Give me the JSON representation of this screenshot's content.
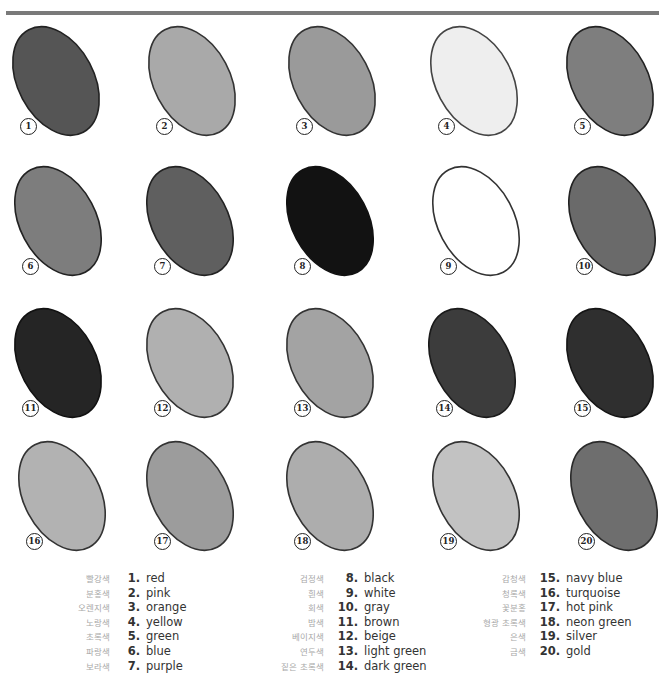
{
  "page": {
    "rule_color": "#7a7a7a"
  },
  "swatches": [
    {
      "number": "1",
      "name": "red",
      "fill": "#555555",
      "stroke": "#222222",
      "x": 12,
      "y": 28
    },
    {
      "number": "2",
      "name": "pink",
      "fill": "#a9a9a9",
      "stroke": "#333333",
      "x": 148,
      "y": 28
    },
    {
      "number": "3",
      "name": "orange",
      "fill": "#9a9a9a",
      "stroke": "#333333",
      "x": 288,
      "y": 28
    },
    {
      "number": "4",
      "name": "yellow",
      "fill": "#eeeeee",
      "stroke": "#444444",
      "x": 430,
      "y": 28
    },
    {
      "number": "5",
      "name": "green",
      "fill": "#7e7e7e",
      "stroke": "#222222",
      "x": 566,
      "y": 28
    },
    {
      "number": "6",
      "name": "blue",
      "fill": "#7d7d7d",
      "stroke": "#222222",
      "x": 14,
      "y": 168
    },
    {
      "number": "7",
      "name": "purple",
      "fill": "#5f5f5f",
      "stroke": "#222222",
      "x": 146,
      "y": 168
    },
    {
      "number": "8",
      "name": "black",
      "fill": "#121212",
      "stroke": "#111111",
      "x": 286,
      "y": 168
    },
    {
      "number": "9",
      "name": "white",
      "fill": "#ffffff",
      "stroke": "#333333",
      "x": 432,
      "y": 168
    },
    {
      "number": "10",
      "name": "gray",
      "fill": "#6a6a6a",
      "stroke": "#222222",
      "x": 568,
      "y": 168
    },
    {
      "number": "11",
      "name": "brown",
      "fill": "#252525",
      "stroke": "#111111",
      "x": 14,
      "y": 310
    },
    {
      "number": "12",
      "name": "beige",
      "fill": "#b0b0b0",
      "stroke": "#333333",
      "x": 146,
      "y": 310
    },
    {
      "number": "13",
      "name": "light green",
      "fill": "#a3a3a3",
      "stroke": "#333333",
      "x": 286,
      "y": 310
    },
    {
      "number": "14",
      "name": "dark green",
      "fill": "#3c3c3c",
      "stroke": "#1a1a1a",
      "x": 428,
      "y": 310
    },
    {
      "number": "15",
      "name": "navy blue",
      "fill": "#2f2f2f",
      "stroke": "#151515",
      "x": 566,
      "y": 310
    },
    {
      "number": "16",
      "name": "turquoise",
      "fill": "#b2b2b2",
      "stroke": "#333333",
      "x": 18,
      "y": 443
    },
    {
      "number": "17",
      "name": "hot pink",
      "fill": "#9c9c9c",
      "stroke": "#333333",
      "x": 146,
      "y": 443
    },
    {
      "number": "18",
      "name": "neon green",
      "fill": "#adadad",
      "stroke": "#333333",
      "x": 286,
      "y": 443
    },
    {
      "number": "19",
      "name": "silver",
      "fill": "#c2c2c2",
      "stroke": "#333333",
      "x": 432,
      "y": 443
    },
    {
      "number": "20",
      "name": "gold",
      "fill": "#6e6e6e",
      "stroke": "#2a2a2a",
      "x": 570,
      "y": 443
    }
  ],
  "legend": {
    "columns": [
      {
        "x": 66,
        "ko_width": 44,
        "num_width": 20,
        "items": [
          {
            "ko": "빨강색",
            "num": "1.",
            "en": "red"
          },
          {
            "ko": "분홍색",
            "num": "2.",
            "en": "pink"
          },
          {
            "ko": "오렌지색",
            "num": "3.",
            "en": "orange"
          },
          {
            "ko": "노랑색",
            "num": "4.",
            "en": "yellow"
          },
          {
            "ko": "초록색",
            "num": "5.",
            "en": "green"
          },
          {
            "ko": "파랑색",
            "num": "6.",
            "en": "blue"
          },
          {
            "ko": "보라색",
            "num": "7.",
            "en": "purple"
          }
        ]
      },
      {
        "x": 268,
        "ko_width": 56,
        "num_width": 24,
        "items": [
          {
            "ko": "검정색",
            "num": "8.",
            "en": "black"
          },
          {
            "ko": "흰색",
            "num": "9.",
            "en": "white"
          },
          {
            "ko": "회색",
            "num": "10.",
            "en": "gray"
          },
          {
            "ko": "밤색",
            "num": "11.",
            "en": "brown"
          },
          {
            "ko": "베이지색",
            "num": "12.",
            "en": "beige"
          },
          {
            "ko": "연두색",
            "num": "13.",
            "en": "light green"
          },
          {
            "ko": "짙은 초록색",
            "num": "14.",
            "en": "dark green"
          }
        ]
      },
      {
        "x": 468,
        "ko_width": 58,
        "num_width": 24,
        "items": [
          {
            "ko": "감청색",
            "num": "15.",
            "en": "navy blue"
          },
          {
            "ko": "청록색",
            "num": "16.",
            "en": "turquoise"
          },
          {
            "ko": "꽃분홍",
            "num": "17.",
            "en": "hot pink"
          },
          {
            "ko": "형광 초록색",
            "num": "18.",
            "en": "neon green"
          },
          {
            "ko": "은색",
            "num": "19.",
            "en": "silver"
          },
          {
            "ko": "금색",
            "num": "20.",
            "en": "gold"
          }
        ]
      }
    ]
  }
}
